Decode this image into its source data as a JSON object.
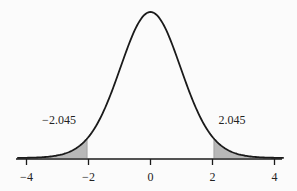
{
  "chart_data": {
    "type": "area",
    "title": "",
    "xlabel": "",
    "ylabel": "",
    "xlim": [
      -4.3,
      4.3
    ],
    "x_ticks": [
      -4,
      -2,
      0,
      2,
      4
    ],
    "x_tick_labels": [
      "−4",
      "−2",
      "0",
      "2",
      "4"
    ],
    "critical_values": [
      -2.045,
      2.045
    ],
    "annotations": [
      {
        "text": "−2.045",
        "x": -2.045,
        "position": "left-tail"
      },
      {
        "text": "2.045",
        "x": 2.045,
        "position": "right-tail"
      }
    ],
    "shaded_regions": [
      {
        "from": -4.3,
        "to": -2.045
      },
      {
        "from": 2.045,
        "to": 4.3
      }
    ],
    "curve_peak": {
      "x": 0
    },
    "grid": false,
    "legend": null
  },
  "colors": {
    "curve": "#1a1a1a",
    "shade": "#b8b8b8",
    "axis": "#1a1a1a",
    "background": "#fbfbfb"
  }
}
